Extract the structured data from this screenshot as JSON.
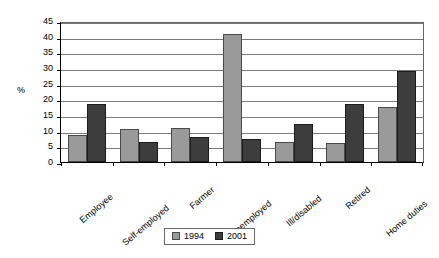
{
  "chart_data": {
    "type": "bar",
    "title": "",
    "xlabel": "",
    "ylabel": "%",
    "ylim": [
      0,
      45
    ],
    "ytick_step": 5,
    "yticks": [
      "0",
      "5",
      "10",
      "15",
      "20",
      "25",
      "30",
      "35",
      "40",
      "45"
    ],
    "grid": true,
    "legend_position": "bottom-center",
    "categories": [
      "Employee",
      "Self-employed",
      "Farmer",
      "Unemployed",
      "Ill/disabled",
      "Retired",
      "Home duties"
    ],
    "series": [
      {
        "name": "1994",
        "color": "#9a9a9a",
        "values": [
          8.5,
          10.5,
          11.0,
          41.0,
          6.5,
          6.0,
          17.5
        ]
      },
      {
        "name": "2001",
        "color": "#3d3d3d",
        "values": [
          18.5,
          6.3,
          8.0,
          7.5,
          12.0,
          18.5,
          29.0
        ]
      }
    ]
  },
  "legend": {
    "entries": [
      {
        "label": "1994"
      },
      {
        "label": "2001"
      }
    ]
  }
}
